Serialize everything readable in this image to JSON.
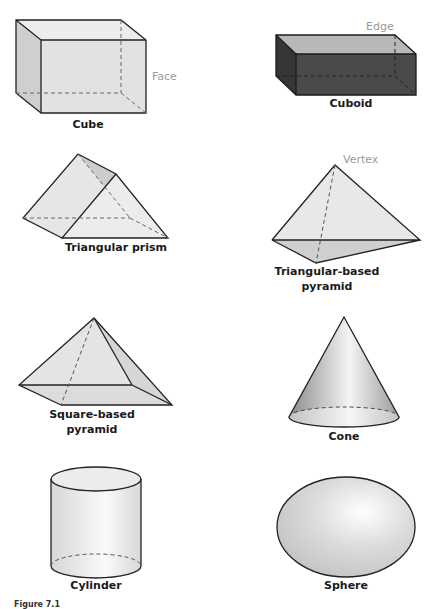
{
  "figure": {
    "caption": "Figure 7.1"
  },
  "colors": {
    "face_fill": "#e4e4e4",
    "face_fill_dark": "#d2d2d2",
    "cuboid_front": "#4a4a4a",
    "cuboid_side": "#363636",
    "cuboid_top": "#b8b8b8",
    "edge_stroke": "#222222",
    "annotation": "#9a9a9a"
  },
  "shapes": [
    {
      "id": "cube",
      "label": "Cube",
      "annotation": "Face"
    },
    {
      "id": "cuboid",
      "label": "Cuboid",
      "annotation": "Edge"
    },
    {
      "id": "triangular-prism",
      "label": "Triangular prism"
    },
    {
      "id": "triangular-pyramid",
      "label_line1": "Triangular-based",
      "label_line2": "pyramid",
      "annotation": "Vertex"
    },
    {
      "id": "square-pyramid",
      "label_line1": "Square-based",
      "label_line2": "pyramid"
    },
    {
      "id": "cone",
      "label": "Cone"
    },
    {
      "id": "cylinder",
      "label": "Cylinder"
    },
    {
      "id": "sphere",
      "label": "Sphere"
    }
  ]
}
